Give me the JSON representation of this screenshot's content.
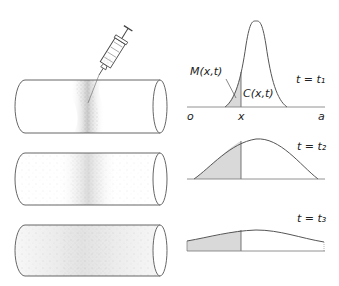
{
  "figure": {
    "syringe": {
      "icon": "syringe-icon"
    },
    "tubes": [
      {
        "time": "t1",
        "spread": "narrow band"
      },
      {
        "time": "t2",
        "spread": "wider band"
      },
      {
        "time": "t3",
        "spread": "nearly uniform"
      }
    ],
    "plots": [
      {
        "time_label": "t = t₁",
        "origin_label": "o",
        "x_label": "x",
        "end_label": "a",
        "mass_label": "M(x,t)",
        "conc_label": "C(x,t)"
      },
      {
        "time_label": "t = t₂"
      },
      {
        "time_label": "t = t₃"
      }
    ]
  },
  "colors": {
    "line": "#555555",
    "shade": "#d9d9d9",
    "dots": "#777777"
  }
}
